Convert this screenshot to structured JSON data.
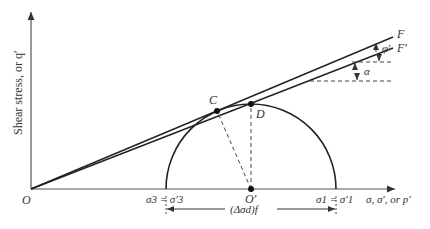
{
  "diagram": {
    "y_axis_label": "Shear stress, or q′",
    "x_axis_label": "σ, σ′, or p′",
    "origin_label": "O",
    "center_label": "O′",
    "point_c_label": "C",
    "point_d_label": "D",
    "line_f_label": "F",
    "line_f_prime_label": "F′",
    "phi_label": "φ′",
    "alpha_label": "α",
    "sigma3_label": "σ3 = σ′3",
    "sigma1_label": "σ1 = σ′1",
    "deviator_label": "(Δσd)f"
  }
}
